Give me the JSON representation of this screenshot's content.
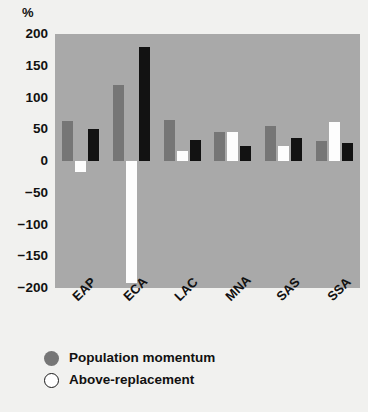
{
  "chart_data": {
    "type": "bar",
    "title": "",
    "subtitle": "",
    "xlabel": "",
    "ylabel": "",
    "unit_label": "%",
    "ylim": [
      -200,
      200
    ],
    "yticks": [
      200,
      150,
      100,
      50,
      0,
      -50,
      -100,
      -150,
      -200
    ],
    "ytick_labels": [
      "200",
      "150",
      "100",
      "50",
      "0",
      "−50",
      "−100",
      "−150",
      "−200"
    ],
    "grid": false,
    "legend_position": "bottom-left",
    "categories": [
      "EAP",
      "ECA",
      "LAC",
      "MNA",
      "SAS",
      "SSA"
    ],
    "series": [
      {
        "name": "Population momentum",
        "color": "#767676",
        "values": [
          63,
          120,
          65,
          45,
          55,
          31
        ]
      },
      {
        "name": "Above-replacement",
        "color": "#ffffff",
        "values": [
          -18,
          -192,
          16,
          45,
          23,
          62
        ]
      },
      {
        "name": "",
        "color": "#121212",
        "values": [
          51,
          180,
          33,
          23,
          37,
          28
        ]
      }
    ]
  },
  "legend": {
    "items": [
      {
        "label": "Population momentum",
        "swatch": "filled-gray-circle"
      },
      {
        "label": "Above-replacement",
        "swatch": "open-white-circle"
      }
    ]
  },
  "colors": {
    "page_background": "#f1f1ef",
    "plot_background": "#a9a9a9",
    "series_gray": "#767676",
    "series_white": "#fdfdfd",
    "series_black": "#121212",
    "text": "#111111"
  }
}
